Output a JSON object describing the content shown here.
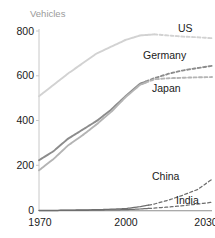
{
  "chart_data": {
    "type": "line",
    "title": "",
    "ylabel": "Vehicles",
    "xlabel": "",
    "xlim": [
      1970,
      2030
    ],
    "ylim": [
      0,
      800
    ],
    "grid": false,
    "legend_position": "inline-right-of-series",
    "xticks": [
      "1970",
      "2000",
      "2030"
    ],
    "xtick_values": [
      1970,
      2000,
      2030
    ],
    "yticks": [
      "0",
      "200",
      "400",
      "600",
      "800"
    ],
    "ytick_values": [
      0,
      200,
      400,
      600,
      800
    ],
    "x": [
      1970,
      1975,
      1980,
      1985,
      1990,
      1995,
      2000,
      2005,
      2010,
      2015,
      2020,
      2025,
      2030
    ],
    "series": [
      {
        "name": "US",
        "color": "#d2d2d2",
        "solid_until": 2010,
        "values": [
          510,
          560,
          610,
          655,
          700,
          730,
          760,
          780,
          785,
          780,
          775,
          772,
          768
        ]
      },
      {
        "name": "Germany",
        "color": "#8c8c8c",
        "solid_until": 2007,
        "values": [
          225,
          265,
          320,
          360,
          400,
          450,
          510,
          565,
          590,
          610,
          625,
          635,
          645
        ]
      },
      {
        "name": "Japan",
        "color": "#b4b4b4",
        "solid_until": 2007,
        "values": [
          180,
          230,
          290,
          335,
          385,
          440,
          505,
          560,
          585,
          590,
          592,
          594,
          595
        ]
      },
      {
        "name": "China",
        "color": "#6e6e6e",
        "solid_until": 2008,
        "values": [
          2,
          2,
          3,
          4,
          5,
          7,
          10,
          18,
          30,
          48,
          70,
          95,
          140
        ]
      },
      {
        "name": "India",
        "color": "#6e6e6e",
        "solid_until": 2008,
        "values": [
          1,
          1,
          2,
          2,
          3,
          4,
          5,
          8,
          12,
          17,
          23,
          30,
          38
        ]
      }
    ],
    "annotations": [
      {
        "text": "US",
        "series": "US"
      },
      {
        "text": "Germany",
        "series": "Germany"
      },
      {
        "text": "Japan",
        "series": "Japan"
      },
      {
        "text": "China",
        "series": "China"
      },
      {
        "text": "India",
        "series": "India"
      }
    ]
  }
}
